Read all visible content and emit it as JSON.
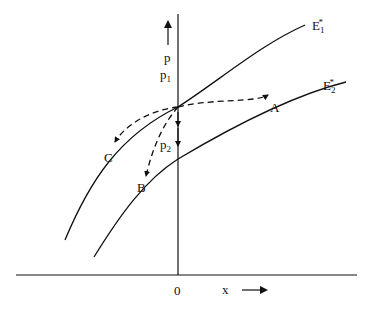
{
  "diagram": {
    "axes": {
      "y_label": "p",
      "x_label": "x",
      "origin_label": "0"
    },
    "curves": [
      {
        "id": "E1",
        "label_main": "E",
        "label_sub": "1",
        "label_sup": "*"
      },
      {
        "id": "E2",
        "label_main": "E",
        "label_sub": "2",
        "label_sup": "*"
      }
    ],
    "points": {
      "p1": {
        "main": "p",
        "sub": "1"
      },
      "p2": {
        "main": "p",
        "sub": "2"
      }
    },
    "paths": {
      "A": "A",
      "B": "B",
      "C": "C"
    },
    "colors": {
      "line": "#111111",
      "background": "#ffffff"
    }
  }
}
